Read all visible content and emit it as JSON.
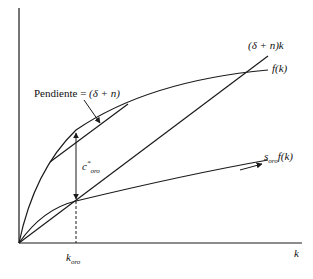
{
  "diagram": {
    "type": "solow-golden-rule",
    "colors": {
      "stroke": "#1a1a1a",
      "background": "#ffffff"
    },
    "axes": {
      "x_label": "k",
      "origin": [
        19,
        243
      ],
      "y_top": 10,
      "x_right": 300
    },
    "curves": [
      {
        "id": "depreciation-line",
        "label": "(δ + n)k",
        "kind": "line"
      },
      {
        "id": "production-function",
        "label": "f(k)",
        "kind": "concave"
      },
      {
        "id": "savings-function",
        "label_base": "s",
        "label_sub": "oro",
        "label_tail": "f(k)",
        "kind": "concave"
      }
    ],
    "tangent": {
      "label_prefix": "Pendiente = ",
      "label_expr": "(δ + n)"
    },
    "consumption": {
      "label_base": "c",
      "label_sup": "*",
      "label_sub": "oro"
    },
    "golden_k": {
      "label_base": "k",
      "label_sub": "oro"
    }
  }
}
